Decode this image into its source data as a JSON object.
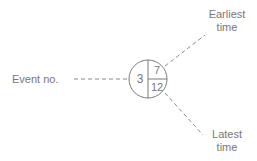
{
  "diagram": {
    "node": {
      "event_no": "3",
      "earliest_time": "7",
      "latest_time": "12"
    },
    "labels": {
      "event_no": "Event no.",
      "earliest_line1": "Earliest",
      "earliest_line2": "time",
      "latest_line1": "Latest",
      "latest_line2": "time"
    },
    "colors": {
      "stroke": "#7a7a7a",
      "text": "#777777",
      "dash": "#8a8a8a"
    }
  }
}
